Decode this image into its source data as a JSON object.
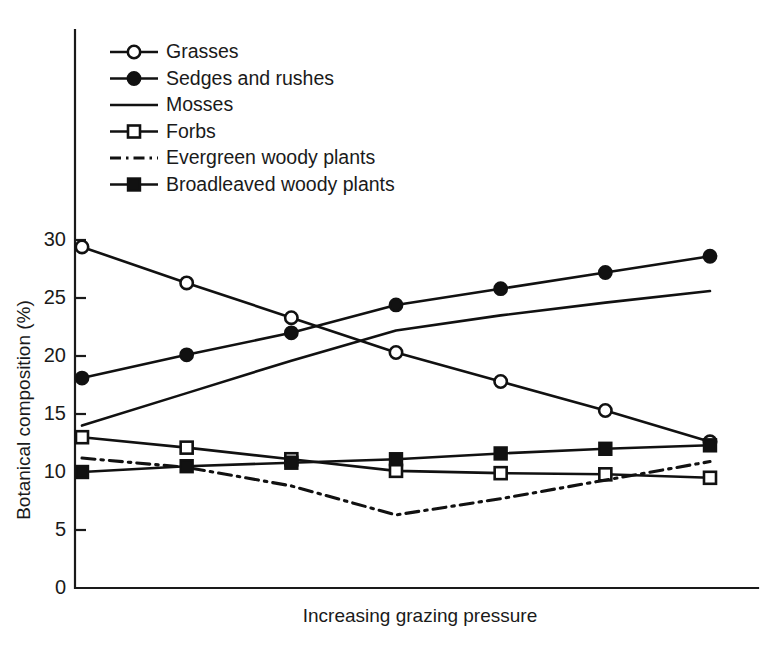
{
  "chart_data": {
    "type": "line",
    "title": "",
    "xlabel": "Increasing grazing pressure",
    "ylabel": "Botanical composition (%)",
    "ylim": [
      0,
      31
    ],
    "yticks": [
      0,
      5,
      10,
      15,
      20,
      25,
      30
    ],
    "ytick_labels": [
      "0",
      "5",
      "10",
      "15",
      "20",
      "25",
      "30"
    ],
    "xticks": [],
    "xtick_labels": [],
    "grid": false,
    "legend_position": "upper-left",
    "x": [
      1,
      2,
      3,
      4,
      5,
      6,
      7
    ],
    "series": [
      {
        "name": "Grasses",
        "marker": "open-circle",
        "linestyle": "solid",
        "values": [
          29.4,
          26.3,
          23.3,
          20.3,
          17.8,
          15.3,
          12.6
        ]
      },
      {
        "name": "Sedges and rushes",
        "marker": "filled-circle",
        "linestyle": "solid",
        "values": [
          18.1,
          20.1,
          22.0,
          24.4,
          25.8,
          27.2,
          28.6
        ]
      },
      {
        "name": "Mosses",
        "marker": "none",
        "linestyle": "solid",
        "values": [
          14.0,
          16.8,
          19.6,
          22.2,
          23.5,
          24.6,
          25.6
        ]
      },
      {
        "name": "Forbs",
        "marker": "open-square",
        "linestyle": "solid",
        "values": [
          13.0,
          12.1,
          11.1,
          10.1,
          9.9,
          9.8,
          9.5
        ]
      },
      {
        "name": "Evergreen woody plants",
        "marker": "none",
        "linestyle": "dash-dot",
        "values": [
          11.2,
          10.4,
          8.8,
          6.3,
          7.7,
          9.3,
          10.9
        ]
      },
      {
        "name": "Broadleaved woody plants",
        "marker": "filled-square",
        "linestyle": "solid",
        "values": [
          10.0,
          10.5,
          10.8,
          11.1,
          11.6,
          12.0,
          12.3
        ]
      }
    ]
  },
  "axes": {
    "y_axis_title": "Botanical composition (%)",
    "x_axis_title": "Increasing grazing pressure"
  },
  "legend": {
    "items": [
      {
        "label": "Grasses",
        "marker": "open-circle",
        "linestyle": "solid"
      },
      {
        "label": "Sedges and rushes",
        "marker": "filled-circle",
        "linestyle": "solid"
      },
      {
        "label": "Mosses",
        "marker": "none",
        "linestyle": "solid"
      },
      {
        "label": "Forbs",
        "marker": "open-square",
        "linestyle": "solid"
      },
      {
        "label": "Evergreen woody plants",
        "marker": "none",
        "linestyle": "dash-dot"
      },
      {
        "label": "Broadleaved woody plants",
        "marker": "filled-square",
        "linestyle": "solid"
      }
    ]
  },
  "colors": {
    "ink": "#111111",
    "background": "#ffffff"
  }
}
